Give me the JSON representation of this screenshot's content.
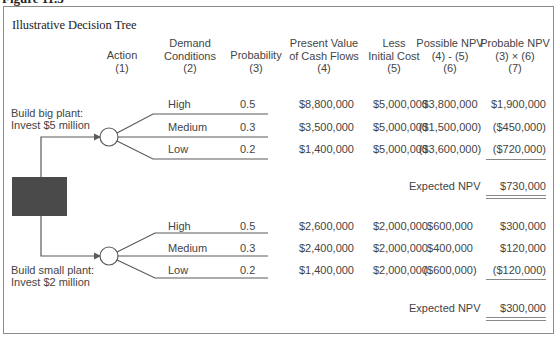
{
  "figure_label": "Figure 11.3",
  "title": "Illustrative Decision Tree",
  "headers": [
    {
      "lines": [
        "Action",
        "(1)"
      ]
    },
    {
      "lines": [
        "Demand",
        "Conditions",
        "(2)"
      ]
    },
    {
      "lines": [
        "Probability",
        "(3)"
      ]
    },
    {
      "lines": [
        "Present Value",
        "of Cash Flows",
        "(4)"
      ]
    },
    {
      "lines": [
        "Less",
        "Initial Cost",
        "(5)"
      ]
    },
    {
      "lines": [
        "Possible NPV",
        "(4) - (5)",
        "(6)"
      ]
    },
    {
      "lines": [
        "Probable NPV",
        "(3) × (6)",
        "(7)"
      ]
    }
  ],
  "decision_node": {
    "icon": "decision-square-icon"
  },
  "branches": [
    {
      "action_lines": [
        "Build big plant:",
        "Invest $5 million"
      ],
      "rows": [
        {
          "demand": "High",
          "probability": "0.5",
          "pv": "$8,800,000",
          "cost": "$5,000,000",
          "possible_npv": "$3,800,000",
          "probable_npv": "$1,900,000"
        },
        {
          "demand": "Medium",
          "probability": "0.3",
          "pv": "$3,500,000",
          "cost": "$5,000,000",
          "possible_npv": "($1,500,000)",
          "probable_npv": "($450,000)"
        },
        {
          "demand": "Low",
          "probability": "0.2",
          "pv": "$1,400,000",
          "cost": "$5,000,000",
          "possible_npv": "($3,600,000)",
          "probable_npv": "($720,000)"
        }
      ],
      "expected_label": "Expected NPV",
      "expected_value": "$730,000"
    },
    {
      "action_lines": [
        "Build small plant:",
        "Invest $2 million"
      ],
      "rows": [
        {
          "demand": "High",
          "probability": "0.5",
          "pv": "$2,600,000",
          "cost": "$2,000,000",
          "possible_npv": "$600,000",
          "probable_npv": "$300,000"
        },
        {
          "demand": "Medium",
          "probability": "0.3",
          "pv": "$2,400,000",
          "cost": "$2,000,000",
          "possible_npv": "$400,000",
          "probable_npv": "$120,000"
        },
        {
          "demand": "Low",
          "probability": "0.2",
          "pv": "$1,400,000",
          "cost": "$2,000,000",
          "possible_npv": "($600,000)",
          "probable_npv": "($120,000)"
        }
      ],
      "expected_label": "Expected NPV",
      "expected_value": "$300,000"
    }
  ],
  "colors": {
    "decision_node_fill": "#4a4a4a",
    "line": "#6a6a6a",
    "frame": "#8a8a8a"
  }
}
